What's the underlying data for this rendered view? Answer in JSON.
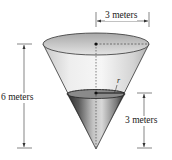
{
  "diagram": {
    "labels": {
      "top_radius": "3 meters",
      "total_height": "6 meters",
      "water_depth": "3 meters",
      "water_radius": "r"
    },
    "colors": {
      "cone_light": "#e6e6e6",
      "cone_mid": "#bdbdbd",
      "cone_dark": "#6e6e6e",
      "water_dark": "#3a3a3a",
      "water_light": "#9a9a9a",
      "line": "#333333",
      "background": "#ffffff"
    }
  }
}
